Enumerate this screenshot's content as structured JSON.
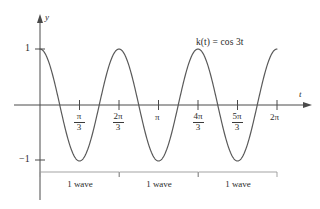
{
  "figure": {
    "title_equation": "k(t) = cos 3t",
    "equation_parts": {
      "func": "k",
      "arg": "t",
      "rhs": "cos 3t"
    },
    "axes": {
      "x_axis_label": "t",
      "y_axis_label": "y"
    },
    "y_ticks": [
      {
        "label": "1",
        "value": 1
      },
      {
        "label": "−1",
        "value": -1
      }
    ],
    "x_ticks": [
      {
        "label": "π/3",
        "num": "π",
        "den": "3",
        "value": 1.0472,
        "is_fraction": true
      },
      {
        "label": "2π/3",
        "num": "2π",
        "den": "3",
        "value": 2.0944,
        "is_fraction": true
      },
      {
        "label": "π",
        "num": "π",
        "den": "",
        "value": 3.1416,
        "is_fraction": false
      },
      {
        "label": "4π/3",
        "num": "4π",
        "den": "3",
        "value": 4.1888,
        "is_fraction": true
      },
      {
        "label": "5π/3",
        "num": "5π",
        "den": "3",
        "value": 5.236,
        "is_fraction": true
      },
      {
        "label": "2π",
        "num": "2π",
        "den": "",
        "value": 6.2832,
        "is_fraction": false
      }
    ],
    "brackets": [
      {
        "label": "1 wave",
        "start": 0,
        "end": 2.0944
      },
      {
        "label": "1 wave",
        "start": 2.0944,
        "end": 4.1888
      },
      {
        "label": "1 wave",
        "start": 4.1888,
        "end": 6.2832
      }
    ],
    "colors": {
      "curve": "#5a5a5a",
      "axis": "#4a4a4a",
      "bracket": "#8e8e8e",
      "text": "#2b2b2b",
      "background": "#ffffff"
    }
  },
  "chart_data": {
    "type": "line",
    "title": "k(t) = cos 3t",
    "xlabel": "t",
    "ylabel": "y",
    "xlim": [
      0,
      6.2832
    ],
    "ylim": [
      -1,
      1
    ],
    "grid": false,
    "legend": "none",
    "annotations": [
      {
        "text": "k(t) = cos 3t",
        "x": 4.6,
        "y": 0.85
      },
      {
        "text": "1 wave",
        "x": 1.05,
        "y": -1.45
      },
      {
        "text": "1 wave",
        "x": 3.14,
        "y": -1.45
      },
      {
        "text": "1 wave",
        "x": 5.24,
        "y": -1.45
      }
    ],
    "series": [
      {
        "name": "k(t) = cos 3t",
        "formula": "cos(3t)",
        "period": 2.0944,
        "amplitude": 1,
        "frequency_multiplier": 3,
        "x": [
          0,
          0.1745,
          0.3491,
          0.5236,
          0.6981,
          0.8727,
          1.0472,
          1.2217,
          1.3963,
          1.5708,
          1.7453,
          1.9199,
          2.0944,
          2.2689,
          2.4435,
          2.618,
          2.7925,
          2.9671,
          3.1416,
          3.3161,
          3.4907,
          3.6652,
          3.8397,
          4.0143,
          4.1888,
          4.3633,
          4.5379,
          4.7124,
          4.8869,
          5.0615,
          5.236,
          5.4105,
          5.5851,
          5.7596,
          5.9341,
          6.1087,
          6.2832
        ],
        "y": [
          1.0,
          0.866,
          0.5,
          0.0,
          -0.5,
          -0.866,
          -1.0,
          -0.866,
          -0.5,
          0.0,
          0.5,
          0.866,
          1.0,
          0.866,
          0.5,
          0.0,
          -0.5,
          -0.866,
          -1.0,
          -0.866,
          -0.5,
          0.0,
          0.5,
          0.866,
          1.0,
          0.866,
          0.5,
          0.0,
          -0.5,
          -0.866,
          -1.0,
          -0.866,
          -0.5,
          0.0,
          0.5,
          0.866,
          1.0
        ]
      }
    ],
    "peaks": [
      {
        "x": 0,
        "y": 1
      },
      {
        "x": 2.0944,
        "y": 1
      },
      {
        "x": 4.1888,
        "y": 1
      },
      {
        "x": 6.2832,
        "y": 1
      }
    ],
    "troughs": [
      {
        "x": 1.0472,
        "y": -1
      },
      {
        "x": 3.1416,
        "y": -1
      },
      {
        "x": 5.236,
        "y": -1
      }
    ]
  }
}
